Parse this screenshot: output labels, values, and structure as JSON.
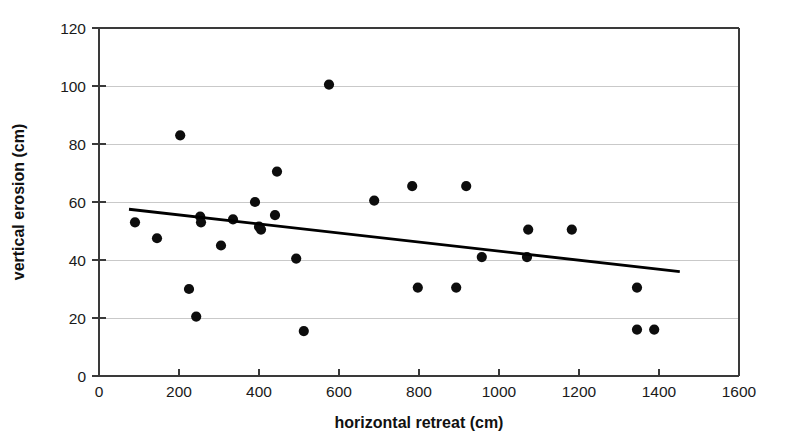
{
  "chart_data": {
    "type": "scatter",
    "title": "",
    "xlabel": "horizontal retreat (cm)",
    "ylabel": "vertical erosion (cm)",
    "xlim": [
      0,
      1600
    ],
    "ylim": [
      0,
      120
    ],
    "xticks": [
      0,
      200,
      400,
      600,
      800,
      1000,
      1200,
      1400,
      1600
    ],
    "yticks": [
      0,
      20,
      40,
      60,
      80,
      100,
      120
    ],
    "xtick_labels": [
      "0",
      "200",
      "400",
      "600",
      "800",
      "1000",
      "1200",
      "1400",
      "1600"
    ],
    "ytick_labels": [
      "0",
      "20",
      "40",
      "60",
      "80",
      "100",
      "120"
    ],
    "grid": "horizontal",
    "legend": "none",
    "series": [
      {
        "name": "erosion measurements",
        "marker": "filled-circle",
        "color": "#0d0d0d",
        "points": [
          {
            "x": 90,
            "y": 53
          },
          {
            "x": 145,
            "y": 47.5
          },
          {
            "x": 203,
            "y": 83
          },
          {
            "x": 225,
            "y": 30
          },
          {
            "x": 243,
            "y": 20.5
          },
          {
            "x": 253,
            "y": 55
          },
          {
            "x": 255,
            "y": 53
          },
          {
            "x": 305,
            "y": 45
          },
          {
            "x": 335,
            "y": 54
          },
          {
            "x": 390,
            "y": 60
          },
          {
            "x": 400,
            "y": 51.5
          },
          {
            "x": 405,
            "y": 50.5
          },
          {
            "x": 440,
            "y": 55.5
          },
          {
            "x": 445,
            "y": 70.5
          },
          {
            "x": 493,
            "y": 40.5
          },
          {
            "x": 512,
            "y": 15.5
          },
          {
            "x": 575,
            "y": 100.5
          },
          {
            "x": 688,
            "y": 60.5
          },
          {
            "x": 783,
            "y": 65.5
          },
          {
            "x": 797,
            "y": 30.5
          },
          {
            "x": 893,
            "y": 30.5
          },
          {
            "x": 918,
            "y": 65.5
          },
          {
            "x": 957,
            "y": 41
          },
          {
            "x": 1070,
            "y": 41
          },
          {
            "x": 1073,
            "y": 50.5
          },
          {
            "x": 1182,
            "y": 50.5
          },
          {
            "x": 1345,
            "y": 30.5
          },
          {
            "x": 1345,
            "y": 16
          },
          {
            "x": 1388,
            "y": 16
          }
        ]
      }
    ],
    "trend_line": {
      "name": "linear regression fit",
      "color": "#000000",
      "x_start": 75,
      "y_start": 57.5,
      "x_end": 1452,
      "y_end": 36
    }
  }
}
